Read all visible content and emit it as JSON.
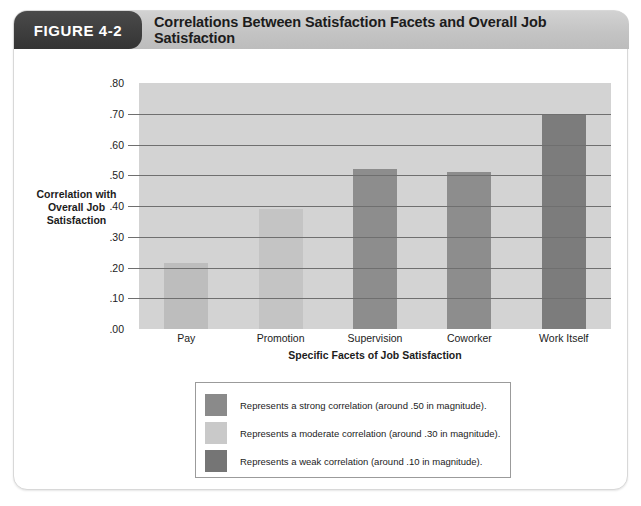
{
  "figure": {
    "number_label": "FIGURE 4-2",
    "caption": "Correlations Between Satisfaction Facets and Overall Job Satisfaction"
  },
  "axes": {
    "y_title_line1": "Correlation with",
    "y_title_line2": "Overall Job",
    "y_title_line3": "Satisfaction",
    "x_title": "Specific Facets of Job Satisfaction"
  },
  "legend": {
    "items": [
      {
        "swatch_name": "legend-swatch-strong",
        "color": "#8a8a8a",
        "text": "Represents a strong correlation (around .50 in magnitude)."
      },
      {
        "swatch_name": "legend-swatch-moderate",
        "color": "#c9c9c9",
        "text": "Represents a moderate correlation (around .30 in magnitude)."
      },
      {
        "swatch_name": "legend-swatch-weak",
        "color": "#757575",
        "text": "Represents a weak correlation (around .10 in magnitude)."
      }
    ]
  },
  "chart_data": {
    "type": "bar",
    "title": "Correlations Between Satisfaction Facets and Overall Job Satisfaction",
    "xlabel": "Specific Facets of Job Satisfaction",
    "ylabel": "Correlation with Overall Job Satisfaction",
    "categories": [
      "Pay",
      "Promotion",
      "Supervision",
      "Coworker",
      "Work Itself"
    ],
    "values": [
      0.215,
      0.39,
      0.52,
      0.51,
      0.7
    ],
    "bar_colors": [
      "#bdbdbd",
      "#c4c4c4",
      "#8d8d8d",
      "#8d8d8d",
      "#7c7c7c"
    ],
    "ylim": [
      0.0,
      0.8
    ],
    "ytick_values": [
      0.8,
      0.7,
      0.6,
      0.5,
      0.4,
      0.3,
      0.2,
      0.1,
      0.0
    ],
    "ytick_labels": [
      ".80",
      ".70",
      ".60",
      ".50",
      ".40",
      ".30",
      ".20",
      ".10",
      ".00"
    ],
    "grid": true,
    "grid_axis": "y",
    "legend_position": "below-plot",
    "plot_background": "#d3d3d3"
  }
}
